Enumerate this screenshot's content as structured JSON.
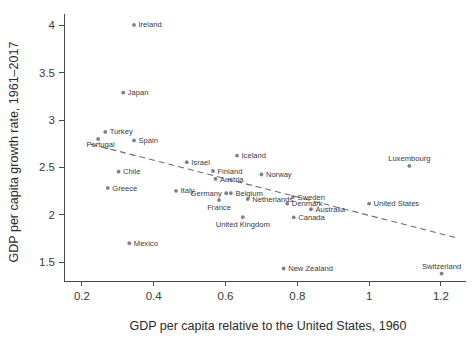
{
  "chart_data": {
    "type": "scatter",
    "title": "",
    "xlabel": "GDP per capita relative to the United States, 1960",
    "ylabel": "GDP per capita growth rate, 1961–2017",
    "xlim": [
      0.15,
      1.27
    ],
    "ylim": [
      1.3,
      4.12
    ],
    "xticks": [
      0.2,
      0.4,
      0.6,
      0.8,
      1,
      1.2
    ],
    "xticklabels": [
      "0.2",
      "0.4",
      "0.6",
      "0.8",
      "1",
      "1.2"
    ],
    "yticks": [
      1.5,
      2,
      2.5,
      3,
      3.5,
      4
    ],
    "yticklabels": [
      "1.5",
      "2",
      "2.5",
      "3",
      "3.5",
      "4"
    ],
    "grid": false,
    "legend": null,
    "marker_color": "#7b7f93",
    "trendline": {
      "style": "dashed",
      "color": "#6e6e6e",
      "x0": 0.225,
      "y0": 2.745,
      "x1": 1.245,
      "y1": 1.755
    },
    "points": [
      {
        "label": "Ireland",
        "x": 0.345,
        "y": 4.005,
        "label_pos": "right"
      },
      {
        "label": "Japan",
        "x": 0.315,
        "y": 3.29,
        "label_pos": "right"
      },
      {
        "label": "Turkey",
        "x": 0.265,
        "y": 2.875,
        "label_pos": "right"
      },
      {
        "label": "Spain",
        "x": 0.345,
        "y": 2.785,
        "label_pos": "right"
      },
      {
        "label": "Portugal",
        "x": 0.245,
        "y": 2.8,
        "label_pos": "below-left"
      },
      {
        "label": "Iceland",
        "x": 0.632,
        "y": 2.625,
        "label_pos": "right"
      },
      {
        "label": "Luxembourg",
        "x": 1.112,
        "y": 2.515,
        "label_pos": "above"
      },
      {
        "label": "Israel",
        "x": 0.492,
        "y": 2.555,
        "label_pos": "right"
      },
      {
        "label": "Chile",
        "x": 0.302,
        "y": 2.455,
        "label_pos": "right"
      },
      {
        "label": "Finland",
        "x": 0.565,
        "y": 2.462,
        "label_pos": "right"
      },
      {
        "label": "Norway",
        "x": 0.7,
        "y": 2.425,
        "label_pos": "right"
      },
      {
        "label": "Austria",
        "x": 0.572,
        "y": 2.378,
        "label_pos": "right"
      },
      {
        "label": "Greece",
        "x": 0.272,
        "y": 2.283,
        "label_pos": "right"
      },
      {
        "label": "Italy",
        "x": 0.462,
        "y": 2.252,
        "label_pos": "right"
      },
      {
        "label": "Germany",
        "x": 0.602,
        "y": 2.228,
        "label_pos": "left"
      },
      {
        "label": "Belgium",
        "x": 0.615,
        "y": 2.228,
        "label_pos": "right"
      },
      {
        "label": "Netherlands",
        "x": 0.662,
        "y": 2.165,
        "label_pos": "right"
      },
      {
        "label": "France",
        "x": 0.582,
        "y": 2.155,
        "label_pos": "below"
      },
      {
        "label": "Sweden",
        "x": 0.788,
        "y": 2.188,
        "label_pos": "right"
      },
      {
        "label": "Denmark",
        "x": 0.772,
        "y": 2.118,
        "label_pos": "right"
      },
      {
        "label": "United States",
        "x": 1.0,
        "y": 2.118,
        "label_pos": "right"
      },
      {
        "label": "Australia",
        "x": 0.838,
        "y": 2.058,
        "label_pos": "right"
      },
      {
        "label": "Canada",
        "x": 0.79,
        "y": 1.972,
        "label_pos": "right"
      },
      {
        "label": "United Kingdom",
        "x": 0.648,
        "y": 1.975,
        "label_pos": "below"
      },
      {
        "label": "Mexico",
        "x": 0.332,
        "y": 1.7,
        "label_pos": "right"
      },
      {
        "label": "New Zealand",
        "x": 0.762,
        "y": 1.432,
        "label_pos": "right"
      },
      {
        "label": "Switzerland",
        "x": 1.202,
        "y": 1.378,
        "label_pos": "above"
      }
    ]
  }
}
